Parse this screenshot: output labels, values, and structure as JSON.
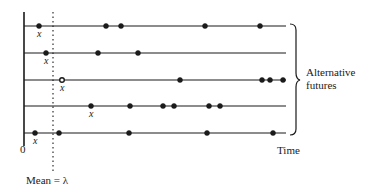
{
  "diagram": {
    "axis_origin_label": "0",
    "time_label": "Time",
    "mean_label": "Mean = λ",
    "brace_label_line1": "Alternative",
    "brace_label_line2": "futures",
    "event_marker_label": "x",
    "colors": {
      "ink": "#1a1a1a",
      "background": "#ffffff"
    },
    "futures": [
      {
        "y": 26,
        "first_event_open": false,
        "events": [
          39,
          106,
          121,
          205,
          260
        ]
      },
      {
        "y": 53,
        "first_event_open": false,
        "events": [
          46,
          98,
          138
        ]
      },
      {
        "y": 80,
        "first_event_open": true,
        "events": [
          62,
          180,
          262,
          270,
          283
        ]
      },
      {
        "y": 106,
        "first_event_open": false,
        "events": [
          91,
          130,
          163,
          174,
          209,
          220
        ]
      },
      {
        "y": 133,
        "first_event_open": false,
        "events": [
          35,
          59,
          129,
          207,
          273
        ]
      }
    ]
  }
}
